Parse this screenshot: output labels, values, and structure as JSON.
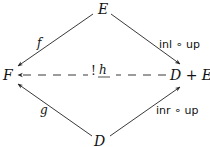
{
  "nodes": {
    "top": "E",
    "left": "F",
    "right": "D + E",
    "bottom": "D"
  },
  "arrows": {
    "top_left": {
      "label": "f"
    },
    "top_right": {
      "label": "inl ∘ up"
    },
    "bottom_left": {
      "label": "g"
    },
    "bottom_right": {
      "label": "inr ∘ up"
    },
    "dashed": {
      "label_prefix": "!",
      "label": "h"
    }
  }
}
